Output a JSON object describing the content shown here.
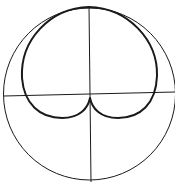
{
  "diagram": {
    "type": "polar-radiation-pattern",
    "width": 175,
    "height": 189,
    "background": "#ffffff",
    "stroke_color": "#1a1a1a",
    "reference_circle": {
      "cx": 89.5,
      "cy": 94,
      "r": 86,
      "stroke_width": 1
    },
    "axes": {
      "horizontal": {
        "x1": 4,
        "y1": 96,
        "x2": 175,
        "y2": 92
      },
      "vertical": {
        "x1": 89,
        "y1": 6,
        "x2": 91,
        "y2": 182
      }
    },
    "pattern": {
      "description": "heart-shaped (cardioid-like) pattern with cusp at origin",
      "stroke_width": 2,
      "cusp": {
        "x": 90,
        "y": 98
      },
      "path": "M 90 98 C 88 108, 80 118, 62 118 C 40 118, 24 104, 22 78 C 20 40, 50 8, 89 7 C 128 8, 158 40, 157 76 C 156 104, 140 118, 118 118 C 100 118, 92 108, 90 98 Z"
    }
  }
}
